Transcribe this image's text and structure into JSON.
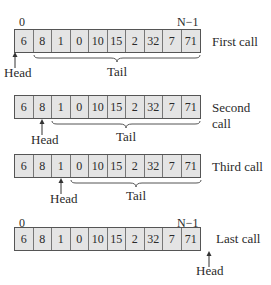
{
  "panels": [
    {
      "label": "First call",
      "values": [
        "6",
        "8",
        "1",
        "0",
        "10",
        "15",
        "2",
        "32",
        "7",
        "71"
      ],
      "head_index": 0,
      "show_indices": true,
      "tail": "Tail",
      "head": "Head"
    },
    {
      "label": "Second call",
      "values": [
        "6",
        "8",
        "1",
        "0",
        "10",
        "15",
        "2",
        "32",
        "7",
        "71"
      ],
      "head_index": 1,
      "show_indices": false,
      "tail": "Tail",
      "head": "Head"
    },
    {
      "label": "Third call",
      "values": [
        "6",
        "8",
        "1",
        "0",
        "10",
        "15",
        "2",
        "32",
        "7",
        "71"
      ],
      "head_index": 2,
      "show_indices": false,
      "tail": "Tail",
      "head": "Head"
    },
    {
      "label": "Last call",
      "values": [
        "6",
        "8",
        "1",
        "0",
        "10",
        "15",
        "2",
        "32",
        "7",
        "71"
      ],
      "head_index": 10,
      "show_indices": true,
      "tail": "",
      "head": "Head"
    }
  ],
  "indices": {
    "first": "0",
    "last": "N−1"
  }
}
